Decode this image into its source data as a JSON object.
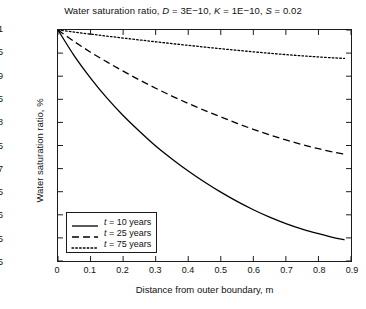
{
  "chart_data": {
    "type": "line",
    "title": "Water saturation ratio, D = 3E−10, K = 1E−10, S = 0.02",
    "title_parts": {
      "main": "Water saturation ratio,",
      "var_d": "D",
      "val_d": " = 3E−10,",
      "var_k": "K",
      "val_k": " = 1E−10,",
      "var_s": "S",
      "val_s": " = 0.02"
    },
    "xlabel": "Distance from outer boundary, m",
    "ylabel": "Water saturation ratio, %",
    "xlim": [
      0,
      0.9
    ],
    "ylim": [
      0.5,
      1.0
    ],
    "grid": false,
    "legend_position": "lower left",
    "xticks": [
      0,
      0.1,
      0.2,
      0.3,
      0.4,
      0.5,
      0.6,
      0.7,
      0.8,
      0.9
    ],
    "xtick_labels": [
      "0",
      "0.1",
      "0.2",
      "0.3",
      "0.4",
      "0.5",
      "0.6",
      "0.7",
      "0.8",
      "0.9"
    ],
    "yticks": [
      0.5,
      0.55,
      0.6,
      0.65,
      0.7,
      0.75,
      0.8,
      0.85,
      0.9,
      0.95,
      1.0
    ],
    "ytick_labels": [
      "0.5",
      "0.55",
      "0.6",
      "0.65",
      "0.7",
      "0.75",
      "0.8",
      "0.85",
      "0.9",
      "0.95",
      "1"
    ],
    "x": [
      0,
      0.05,
      0.1,
      0.15,
      0.2,
      0.25,
      0.3,
      0.35,
      0.4,
      0.45,
      0.5,
      0.55,
      0.6,
      0.65,
      0.7,
      0.75,
      0.8,
      0.85,
      0.88
    ],
    "series": [
      {
        "name": "t = 10 years",
        "label_var": "t",
        "label_rest": " = 10 years",
        "style": "solid",
        "color": "#000000",
        "values": [
          1.0,
          0.944,
          0.896,
          0.853,
          0.815,
          0.781,
          0.749,
          0.721,
          0.695,
          0.671,
          0.649,
          0.629,
          0.611,
          0.595,
          0.581,
          0.569,
          0.559,
          0.55,
          0.546
        ]
      },
      {
        "name": "t = 25 years",
        "label_var": "t",
        "label_rest": " = 25 years",
        "style": "dashed",
        "color": "#000000",
        "values": [
          1.0,
          0.975,
          0.952,
          0.931,
          0.911,
          0.892,
          0.874,
          0.857,
          0.841,
          0.826,
          0.812,
          0.798,
          0.785,
          0.773,
          0.762,
          0.752,
          0.743,
          0.735,
          0.731
        ]
      },
      {
        "name": "t = 75 years",
        "label_var": "t",
        "label_rest": " = 75 years",
        "style": "dotted",
        "color": "#000000",
        "values": [
          1.0,
          0.9955,
          0.9911,
          0.9868,
          0.9826,
          0.9785,
          0.9745,
          0.9706,
          0.9668,
          0.9631,
          0.9595,
          0.9561,
          0.9528,
          0.9497,
          0.9468,
          0.9441,
          0.9417,
          0.9396,
          0.9385
        ]
      }
    ]
  }
}
